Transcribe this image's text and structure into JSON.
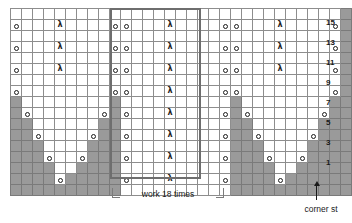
{
  "chart": {
    "columns": 31,
    "rows": 17,
    "cell_px": 10,
    "colors": {
      "grid_line": "#8d8d8d",
      "shaded_cell": "#9a9a9a",
      "empty_cell": "#ffffff",
      "repeat_box": "#6e6e6e",
      "symbol": "#1b1b1b"
    },
    "symbols": {
      "yo": {
        "name": "yarn-over-symbol",
        "glyph": "o",
        "legend": "yarn over"
      },
      "dec": {
        "name": "decrease-symbol",
        "glyph": "λ",
        "legend": "centered decrease"
      },
      "gray": {
        "name": "no-stitch-cell",
        "legend": "no stitch"
      },
      "empty": {
        "name": "knit-cell",
        "legend": "knit"
      }
    },
    "row_numbers": [
      {
        "label": "15",
        "row_index": 1
      },
      {
        "label": "13",
        "row_index": 3
      },
      {
        "label": "11",
        "row_index": 5
      },
      {
        "label": "9",
        "row_index": 7
      },
      {
        "label": "7",
        "row_index": 9
      },
      {
        "label": "5",
        "row_index": 11
      },
      {
        "label": "3",
        "row_index": 13
      },
      {
        "label": "1",
        "row_index": 15
      }
    ],
    "repeat": {
      "label": "work 18 times",
      "start_col": 11,
      "end_col": 19
    },
    "corner": {
      "label": "corner st",
      "col": 30
    },
    "cells": [
      [
        "e",
        "e",
        "e",
        "e",
        "e",
        "e",
        "e",
        "e",
        "e",
        "e",
        "e",
        "e",
        "e",
        "e",
        "e",
        "e",
        "e",
        "e",
        "e",
        "e",
        "e",
        "e",
        "e",
        "e",
        "e",
        "e",
        "e",
        "e",
        "e",
        "e",
        "g"
      ],
      [
        "o",
        "e",
        "e",
        "e",
        "d",
        "e",
        "e",
        "e",
        "e",
        "o",
        "o",
        "e",
        "e",
        "e",
        "d",
        "e",
        "e",
        "e",
        "e",
        "o",
        "o",
        "e",
        "e",
        "e",
        "d",
        "e",
        "e",
        "e",
        "e",
        "o",
        "g"
      ],
      [
        "e",
        "e",
        "e",
        "e",
        "e",
        "e",
        "e",
        "e",
        "e",
        "e",
        "e",
        "e",
        "e",
        "e",
        "e",
        "e",
        "e",
        "e",
        "e",
        "e",
        "e",
        "e",
        "e",
        "e",
        "e",
        "e",
        "e",
        "e",
        "e",
        "e",
        "g"
      ],
      [
        "o",
        "e",
        "e",
        "e",
        "d",
        "e",
        "e",
        "e",
        "e",
        "o",
        "o",
        "e",
        "e",
        "e",
        "d",
        "e",
        "e",
        "e",
        "e",
        "o",
        "o",
        "e",
        "e",
        "e",
        "d",
        "e",
        "e",
        "e",
        "e",
        "o",
        "g"
      ],
      [
        "e",
        "e",
        "e",
        "e",
        "e",
        "e",
        "e",
        "e",
        "e",
        "e",
        "e",
        "e",
        "e",
        "e",
        "e",
        "e",
        "e",
        "e",
        "e",
        "e",
        "e",
        "e",
        "e",
        "e",
        "e",
        "e",
        "e",
        "e",
        "e",
        "e",
        "g"
      ],
      [
        "o",
        "e",
        "e",
        "e",
        "d",
        "e",
        "e",
        "e",
        "e",
        "o",
        "o",
        "e",
        "e",
        "e",
        "d",
        "e",
        "e",
        "e",
        "e",
        "o",
        "o",
        "e",
        "e",
        "e",
        "d",
        "e",
        "e",
        "e",
        "e",
        "o",
        "g"
      ],
      [
        "e",
        "e",
        "e",
        "e",
        "e",
        "e",
        "e",
        "e",
        "e",
        "e",
        "e",
        "e",
        "e",
        "e",
        "e",
        "e",
        "e",
        "e",
        "e",
        "e",
        "e",
        "e",
        "e",
        "e",
        "e",
        "e",
        "e",
        "e",
        "e",
        "e",
        "g"
      ],
      [
        "o",
        "e",
        "e",
        "e",
        "e",
        "e",
        "e",
        "e",
        "e",
        "o",
        "o",
        "e",
        "e",
        "e",
        "d",
        "e",
        "e",
        "e",
        "e",
        "o",
        "o",
        "e",
        "e",
        "e",
        "e",
        "e",
        "e",
        "e",
        "e",
        "o",
        "g"
      ],
      [
        "g",
        "e",
        "e",
        "e",
        "e",
        "e",
        "e",
        "e",
        "e",
        "g",
        "e",
        "e",
        "e",
        "e",
        "e",
        "e",
        "e",
        "e",
        "e",
        "e",
        "g",
        "e",
        "e",
        "e",
        "e",
        "e",
        "e",
        "e",
        "e",
        "g",
        "g"
      ],
      [
        "g",
        "o",
        "e",
        "e",
        "e",
        "e",
        "e",
        "e",
        "o",
        "g",
        "o",
        "e",
        "e",
        "e",
        "d",
        "e",
        "e",
        "e",
        "e",
        "o",
        "g",
        "o",
        "e",
        "e",
        "e",
        "e",
        "e",
        "e",
        "o",
        "g",
        "g"
      ],
      [
        "g",
        "g",
        "e",
        "e",
        "e",
        "e",
        "e",
        "e",
        "g",
        "g",
        "e",
        "e",
        "e",
        "e",
        "e",
        "e",
        "e",
        "e",
        "e",
        "e",
        "g",
        "g",
        "e",
        "e",
        "e",
        "e",
        "e",
        "e",
        "g",
        "g",
        "g"
      ],
      [
        "g",
        "g",
        "o",
        "e",
        "e",
        "e",
        "e",
        "o",
        "g",
        "g",
        "o",
        "e",
        "e",
        "e",
        "d",
        "e",
        "e",
        "e",
        "e",
        "o",
        "g",
        "g",
        "o",
        "e",
        "e",
        "e",
        "e",
        "o",
        "g",
        "g",
        "g"
      ],
      [
        "g",
        "g",
        "g",
        "e",
        "e",
        "e",
        "e",
        "g",
        "g",
        "g",
        "e",
        "e",
        "e",
        "e",
        "e",
        "e",
        "e",
        "e",
        "e",
        "e",
        "g",
        "g",
        "g",
        "e",
        "e",
        "e",
        "e",
        "g",
        "g",
        "g",
        "g"
      ],
      [
        "g",
        "g",
        "g",
        "o",
        "e",
        "e",
        "o",
        "g",
        "g",
        "g",
        "o",
        "e",
        "e",
        "e",
        "d",
        "e",
        "e",
        "e",
        "e",
        "o",
        "g",
        "g",
        "g",
        "o",
        "e",
        "e",
        "o",
        "g",
        "g",
        "g",
        "g"
      ],
      [
        "g",
        "g",
        "g",
        "g",
        "e",
        "e",
        "g",
        "g",
        "g",
        "g",
        "e",
        "e",
        "e",
        "e",
        "e",
        "e",
        "e",
        "e",
        "e",
        "e",
        "g",
        "g",
        "g",
        "g",
        "e",
        "e",
        "g",
        "g",
        "g",
        "g",
        "g"
      ],
      [
        "g",
        "g",
        "g",
        "g",
        "o",
        "g",
        "g",
        "g",
        "g",
        "g",
        "o",
        "e",
        "e",
        "e",
        "d",
        "e",
        "e",
        "e",
        "e",
        "o",
        "g",
        "g",
        "g",
        "g",
        "o",
        "g",
        "g",
        "g",
        "g",
        "g",
        "g"
      ],
      [
        "g",
        "g",
        "g",
        "g",
        "g",
        "g",
        "g",
        "g",
        "g",
        "g",
        "e",
        "e",
        "e",
        "e",
        "e",
        "e",
        "e",
        "e",
        "e",
        "e",
        "g",
        "g",
        "g",
        "g",
        "g",
        "g",
        "g",
        "g",
        "g",
        "g",
        "g"
      ]
    ]
  }
}
